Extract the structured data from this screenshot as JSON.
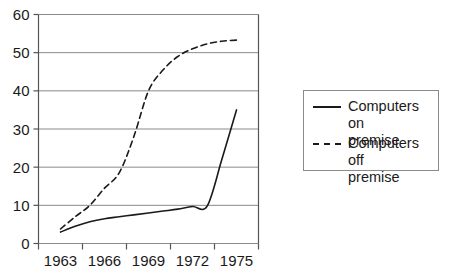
{
  "chart_data": {
    "type": "line",
    "title": "",
    "xlabel": "",
    "ylabel": "",
    "xlim": [
      1962,
      1976.5
    ],
    "ylim": [
      0,
      60
    ],
    "grid": true,
    "legend_position": "right-outside",
    "x_tick_labels": [
      "1963",
      "1966",
      "1969",
      "1972",
      "1975"
    ],
    "y_tick_labels": [
      "0",
      "10",
      "20",
      "30",
      "40",
      "50",
      "60"
    ],
    "y_ticks": [
      0,
      10,
      20,
      30,
      40,
      50,
      60
    ],
    "series": [
      {
        "name": "Computers on premise",
        "style": "solid",
        "color": "#1a1a1a",
        "x": [
          1963,
          1964,
          1965,
          1966,
          1967,
          1968,
          1969,
          1970,
          1971,
          1972,
          1973,
          1974,
          1975
        ],
        "values": [
          3.0,
          4.5,
          5.7,
          6.5,
          7.0,
          7.5,
          8.0,
          8.5,
          9.0,
          9.7,
          9.8,
          22.0,
          35.0
        ]
      },
      {
        "name": "Computers off premise",
        "style": "dashed",
        "color": "#1a1a1a",
        "x": [
          1963,
          1964,
          1965,
          1966,
          1967,
          1968,
          1969,
          1970,
          1971,
          1972,
          1973,
          1974,
          1975
        ],
        "values": [
          3.8,
          7.0,
          10.0,
          14.5,
          18.5,
          28.0,
          40.0,
          45.5,
          49.0,
          51.0,
          52.3,
          53.0,
          53.3
        ]
      }
    ]
  },
  "legend": {
    "entries": [
      {
        "label": "Computers on\npremise",
        "style": "solid"
      },
      {
        "label": "Computers off\npremise",
        "style": "dashed"
      }
    ]
  },
  "colors": {
    "axis": "#555555",
    "grid": "#8a8a8a",
    "line": "#1a1a1a",
    "text": "#1a1a1a",
    "background": "#ffffff"
  }
}
